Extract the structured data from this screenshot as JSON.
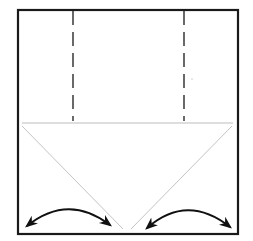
{
  "diagram": {
    "type": "origami-fold-instruction",
    "title": "",
    "colors": {
      "background": "#ffffff",
      "paper_outline": "#1a1a1a",
      "fold_line": "#2a2a2a",
      "crease": "#bdbdbd",
      "arrow": "#111111"
    },
    "paper": {
      "x": 18,
      "y": 10,
      "width": 220,
      "height": 224
    },
    "valley_folds": [
      {
        "name": "left-valley-fold",
        "x": 73,
        "y1": 11,
        "y2": 121
      },
      {
        "name": "right-valley-fold",
        "x": 184,
        "y1": 11,
        "y2": 121
      }
    ],
    "creases": [
      {
        "name": "horizontal-crease",
        "x1": 22,
        "y1": 123,
        "x2": 233,
        "y2": 123
      },
      {
        "name": "left-diagonal-crease",
        "x1": 22,
        "y1": 126,
        "x2": 123,
        "y2": 229
      },
      {
        "name": "right-diagonal-crease",
        "x1": 232,
        "y1": 126,
        "x2": 131,
        "y2": 229
      }
    ],
    "arrows": [
      {
        "name": "left-fold-arrow",
        "from": [
          25,
          226
        ],
        "to": [
          111,
          225
        ],
        "ctrl": [
          68,
          195
        ],
        "double_headed": true
      },
      {
        "name": "right-fold-arrow",
        "from": [
          145,
          228
        ],
        "to": [
          232,
          227
        ],
        "ctrl": [
          186,
          195
        ],
        "double_headed": true
      }
    ]
  }
}
